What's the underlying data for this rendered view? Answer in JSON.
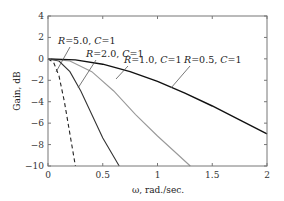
{
  "chart_data": {
    "type": "line",
    "title": "",
    "xlabel": "ω, rad./sec.",
    "ylabel": "Gain, dB",
    "xlim": [
      0,
      2
    ],
    "ylim": [
      -10,
      4
    ],
    "xticks": [
      "0",
      "0.5",
      "1",
      "1.5",
      "2"
    ],
    "yticks": [
      "4",
      "2",
      "0",
      "−2",
      "−4",
      "−6",
      "−8",
      "−10"
    ],
    "grid": false,
    "series": [
      {
        "name": "R=5.0, C=1",
        "style": "dashed",
        "color": "#222222",
        "x": [
          0,
          0.05,
          0.1,
          0.15,
          0.2,
          0.25
        ],
        "y": [
          0,
          -0.3,
          -1.6,
          -4.0,
          -7.0,
          -10
        ]
      },
      {
        "name": "R=2.0, C=1",
        "style": "solid",
        "color": "#333333",
        "x": [
          0,
          0.1,
          0.2,
          0.3,
          0.4,
          0.5,
          0.65
        ],
        "y": [
          0,
          -0.2,
          -1.2,
          -3.0,
          -5.2,
          -7.4,
          -10
        ]
      },
      {
        "name": "R=1.0, C=1",
        "style": "solid",
        "color": "#999999",
        "x": [
          0,
          0.2,
          0.4,
          0.6,
          0.8,
          1.0,
          1.3
        ],
        "y": [
          0,
          -0.2,
          -1.2,
          -3.0,
          -5.2,
          -7.2,
          -10
        ]
      },
      {
        "name": "R=0.5, C=1",
        "style": "solid",
        "color": "#111111",
        "x": [
          0,
          0.25,
          0.5,
          0.75,
          1.0,
          1.25,
          1.5,
          1.75,
          2.0
        ],
        "y": [
          0,
          -0.1,
          -0.5,
          -1.2,
          -2.1,
          -3.2,
          -4.4,
          -5.7,
          -7.0
        ]
      }
    ],
    "annotations": [
      {
        "text": "R=5.0, C=1",
        "points_to": "R=5.0 curve"
      },
      {
        "text": "R=2.0, C=1",
        "points_to": "R=2.0 curve"
      },
      {
        "text": "R=1.0, C=1",
        "points_to": "R=1.0 curve"
      },
      {
        "text": "R=0.5, C=1",
        "points_to": "R=0.5 curve"
      }
    ]
  }
}
